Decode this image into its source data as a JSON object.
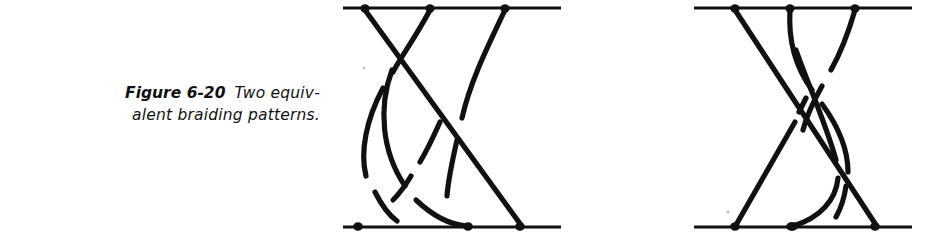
{
  "figure": {
    "number_label": "Figure 6-20",
    "caption_line_1": "Two equiv-",
    "caption_line_2": "alent braiding patterns.",
    "caption_full": "Figure 6-20  Two equivalent braiding patterns.",
    "ink_color": "#111111",
    "background_color": "#ffffff"
  },
  "diagrams": [
    {
      "name": "left-braid",
      "label": "left braiding pattern",
      "strand_count": 3,
      "top_bar": {
        "x1": 343,
        "x2": 561,
        "y": 8
      },
      "bottom_bar": {
        "x1": 343,
        "x2": 561,
        "y": 227
      },
      "top_nodes": [
        365,
        430,
        505
      ],
      "bottom_nodes": [
        358,
        468,
        520
      ],
      "crossing_count": 3
    },
    {
      "name": "right-braid",
      "label": "right braiding pattern",
      "strand_count": 3,
      "top_bar": {
        "x1": 694,
        "x2": 912,
        "y": 8
      },
      "bottom_bar": {
        "x1": 694,
        "x2": 912,
        "y": 227
      },
      "top_nodes": [
        735,
        790,
        855
      ],
      "bottom_nodes": [
        735,
        792,
        875
      ],
      "crossing_count": 3
    }
  ]
}
